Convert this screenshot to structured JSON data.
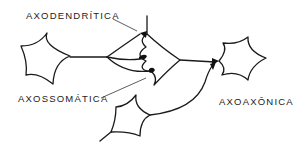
{
  "diagram": {
    "type": "synapse-types-schematic",
    "labels": {
      "axodendritic": "AXODENDRÍTICA",
      "axosomatic": "AXOSSOMÁTICA",
      "axoaxonic": "AXOAXÔNICA"
    },
    "nodes": [
      {
        "id": "neuron-left",
        "kind": "presynaptic-soma"
      },
      {
        "id": "neuron-center",
        "kind": "postsynaptic-soma-with-dendrite"
      },
      {
        "id": "neuron-right",
        "kind": "postsynaptic-soma"
      },
      {
        "id": "neuron-bottom",
        "kind": "presynaptic-soma"
      }
    ],
    "connections": [
      {
        "from": "neuron-left",
        "to": "neuron-center-dendrite",
        "type": "axodendritic"
      },
      {
        "from": "neuron-left",
        "to": "neuron-center-soma",
        "type": "axosomatic"
      },
      {
        "from": "neuron-bottom",
        "to": "neuron-center-axon",
        "type": "axoaxonic"
      },
      {
        "from": "neuron-center",
        "to": "neuron-right",
        "type": "axosomatic"
      }
    ],
    "colors": {
      "stroke": "#1a1a1a",
      "text": "#222222",
      "background": "#ffffff"
    }
  }
}
